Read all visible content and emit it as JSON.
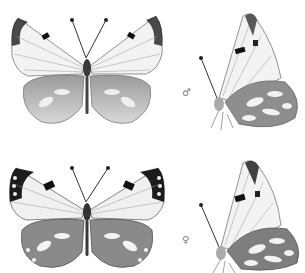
{
  "plate": {
    "specimens": [
      {
        "sex": "male",
        "symbol": "♂",
        "views": [
          "dorsal",
          "lateral"
        ]
      },
      {
        "sex": "female",
        "symbol": "♀",
        "views": [
          "dorsal",
          "lateral"
        ]
      }
    ]
  },
  "colors": {
    "background": "#ffffff",
    "wing": "#f2f2f2",
    "vein": "#8a8a8a",
    "dark_mark": "#1e1e1e",
    "body": "#3a3a3a"
  }
}
